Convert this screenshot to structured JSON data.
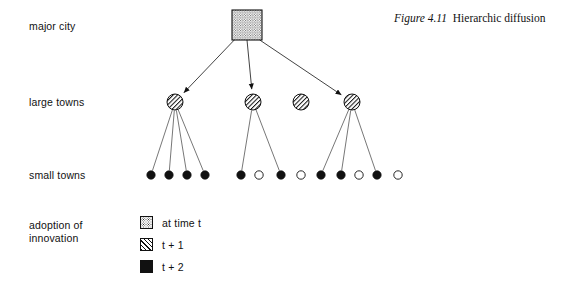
{
  "figure": {
    "caption_number": "Figure 4.11",
    "caption_text": "Hierarchic diffusion",
    "background_color": "#ffffff",
    "ink_color": "#111111"
  },
  "rows": [
    {
      "key": "major_city",
      "label": "major city"
    },
    {
      "key": "large_towns",
      "label": "large towns"
    },
    {
      "key": "small_towns",
      "label": "small towns"
    },
    {
      "key": "adoption",
      "label": "adoption of\ninnovation"
    }
  ],
  "diagram": {
    "major_city": {
      "label": "major city",
      "fill": "stipple",
      "time": "at time t",
      "x": 247,
      "y": 25,
      "width": 30,
      "height": 30
    },
    "large_towns": [
      {
        "id": "lt1",
        "x": 175,
        "y": 102,
        "r": 8,
        "fill": "hatch",
        "time": "t + 1",
        "has_incoming_arrow": true
      },
      {
        "id": "lt2",
        "x": 253,
        "y": 102,
        "r": 8,
        "fill": "hatch",
        "time": "t + 1",
        "has_incoming_arrow": true
      },
      {
        "id": "lt3",
        "x": 301,
        "y": 102,
        "r": 8,
        "fill": "hatch",
        "time": "t + 1",
        "has_incoming_arrow": false
      },
      {
        "id": "lt4",
        "x": 352,
        "y": 102,
        "r": 8,
        "fill": "hatch",
        "time": "t + 1",
        "has_incoming_arrow": true
      }
    ],
    "small_towns": [
      {
        "id": "st1",
        "x": 151,
        "y": 175,
        "r": 4.2,
        "fill": "solid",
        "time": "t + 2"
      },
      {
        "id": "st2",
        "x": 169,
        "y": 175,
        "r": 4.2,
        "fill": "solid",
        "time": "t + 2"
      },
      {
        "id": "st3",
        "x": 187,
        "y": 175,
        "r": 4.2,
        "fill": "solid",
        "time": "t + 2"
      },
      {
        "id": "st4",
        "x": 205,
        "y": 175,
        "r": 4.2,
        "fill": "solid",
        "time": "t + 2"
      },
      {
        "id": "st5",
        "x": 241,
        "y": 175,
        "r": 4.2,
        "fill": "solid",
        "time": "t + 2"
      },
      {
        "id": "st6",
        "x": 259,
        "y": 175,
        "r": 4.2,
        "fill": "open",
        "time": ""
      },
      {
        "id": "st7",
        "x": 281,
        "y": 175,
        "r": 4.2,
        "fill": "solid",
        "time": "t + 2"
      },
      {
        "id": "st8",
        "x": 301,
        "y": 175,
        "r": 4.2,
        "fill": "open",
        "time": ""
      },
      {
        "id": "st9",
        "x": 321,
        "y": 175,
        "r": 4.2,
        "fill": "solid",
        "time": "t + 2"
      },
      {
        "id": "st10",
        "x": 341,
        "y": 175,
        "r": 4.2,
        "fill": "solid",
        "time": "t + 2"
      },
      {
        "id": "st11",
        "x": 359,
        "y": 175,
        "r": 4.2,
        "fill": "open",
        "time": ""
      },
      {
        "id": "st12",
        "x": 377,
        "y": 175,
        "r": 4.2,
        "fill": "solid",
        "time": "t + 2"
      },
      {
        "id": "st13",
        "x": 398,
        "y": 175,
        "r": 4.2,
        "fill": "open",
        "time": ""
      }
    ],
    "arrows": [
      {
        "from": "major_city",
        "to": "lt1"
      },
      {
        "from": "major_city",
        "to": "lt2"
      },
      {
        "from": "major_city",
        "to": "lt4"
      }
    ],
    "links": [
      {
        "from": "lt1",
        "to": "st1"
      },
      {
        "from": "lt1",
        "to": "st2"
      },
      {
        "from": "lt1",
        "to": "st3"
      },
      {
        "from": "lt1",
        "to": "st4"
      },
      {
        "from": "lt2",
        "to": "st5"
      },
      {
        "from": "lt2",
        "to": "st7"
      },
      {
        "from": "lt4",
        "to": "st9"
      },
      {
        "from": "lt4",
        "to": "st10"
      },
      {
        "from": "lt4",
        "to": "st12"
      }
    ]
  },
  "legend": {
    "title": "adoption of\ninnovation",
    "items": [
      {
        "fill": "stipple",
        "label": "at time t"
      },
      {
        "fill": "hatch",
        "label": "t + 1"
      },
      {
        "fill": "solid",
        "label": "t + 2"
      }
    ]
  }
}
